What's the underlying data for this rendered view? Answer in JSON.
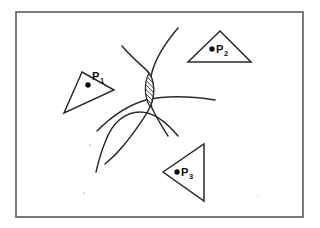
{
  "figure": {
    "background_color": "#ffffff",
    "ink_color": "#2b2b2b",
    "frame_color": "#5a5a5a",
    "frame": {
      "x": 16,
      "y": 12,
      "width": 287,
      "height": 205
    },
    "points": [
      {
        "id": "P1",
        "label": "P",
        "subscript": "1",
        "dot": {
          "cx": 88,
          "cy": 85
        },
        "label_pos": {
          "x": 92,
          "y": 80
        },
        "sub_pos": {
          "x": 100,
          "y": 83
        },
        "polygon_name": "triangle-p1",
        "polygon_points": "82,72 114,90 64,113",
        "shape_note": "thin triangle pointing right"
      },
      {
        "id": "P2",
        "label": "P",
        "subscript": "2",
        "dot": {
          "cx": 212,
          "cy": 49
        },
        "label_pos": {
          "x": 216,
          "y": 53
        },
        "sub_pos": {
          "x": 224,
          "y": 56
        },
        "polygon_name": "triangle-p2",
        "polygon_points": "220,31 251,62 188,62",
        "shape_note": "wide flat triangle"
      },
      {
        "id": "P3",
        "label": "P",
        "subscript": "3",
        "dot": {
          "cx": 177,
          "cy": 172
        },
        "label_pos": {
          "x": 181,
          "y": 176
        },
        "sub_pos": {
          "x": 189,
          "y": 179
        },
        "polygon_name": "triangle-p3",
        "polygon_points": "163,172 204,144 204,201",
        "shape_note": "triangle pointing left"
      }
    ],
    "curves": [
      {
        "name": "curve-left-branch",
        "d": "M 122,46 C 134,60 143,66 149,73 C 155,82 155,96 150,107 C 144,120 134,132 124,145 C 116,155 110,160 105,164",
        "note": "upper-left arm descending through lens then down to lower left"
      },
      {
        "name": "curve-right-branch",
        "d": "M 178,28 C 166,42 156,58 152,72 C 148,86 148,98 152,108 C 157,119 163,128 168,136",
        "note": "upper-right arm descending through lens then to lower right"
      },
      {
        "name": "curve-horizontal",
        "d": "M 97,131 C 112,116 128,105 146,100 C 168,95 196,97 215,100",
        "note": "broad curve crossing lens, ending at right"
      },
      {
        "name": "curve-big-arc",
        "d": "M 178,136 C 168,124 154,112 140,112 C 124,112 112,124 106,140 C 100,154 98,164 96,172",
        "note": "large sweeping arc from right down to lower left"
      }
    ],
    "intersection_region": {
      "name": "hatched-lens",
      "label": "hatched intersection region",
      "outline_d": "M 149,73 C 155,82 155,96 150,107 C 144,96 144,83 149,73 Z",
      "hatch_angle_deg": 45,
      "hatch_count": 7,
      "hatch_spacing_px": 4.5,
      "bbox": {
        "x": 144,
        "y": 72,
        "width": 12,
        "height": 36
      }
    },
    "specks": [
      {
        "cx": 90,
        "cy": 145,
        "r": 1.0
      },
      {
        "cx": 84,
        "cy": 193,
        "r": 0.9
      },
      {
        "cx": 258,
        "cy": 196,
        "r": 0.8
      }
    ]
  }
}
